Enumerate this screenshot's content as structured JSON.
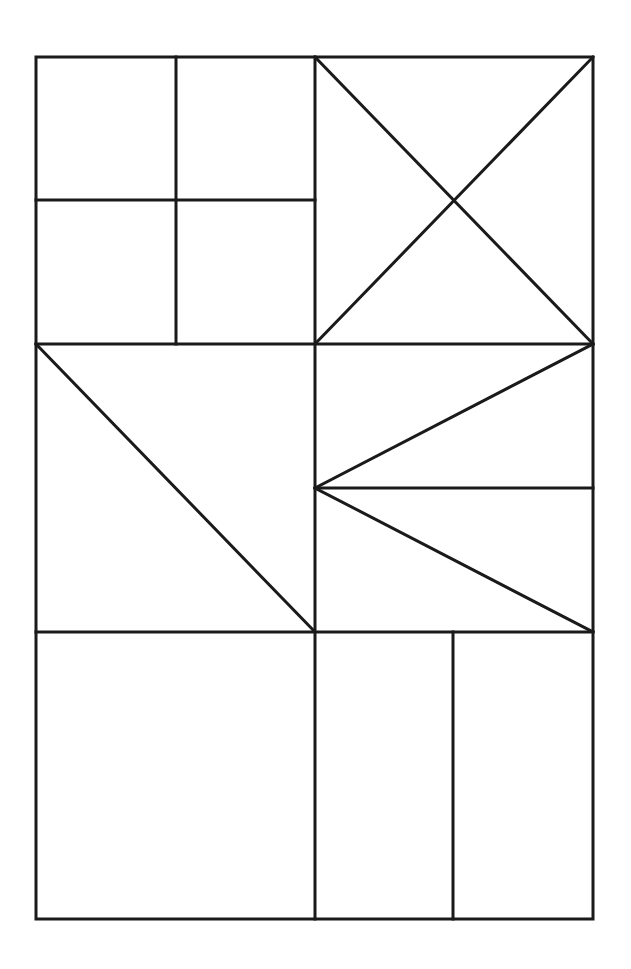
{
  "diagram": {
    "type": "geometric-quilt-grid",
    "stroke_color": "#1a1a1a",
    "background": "#ffffff",
    "outer_frame": {
      "x1": 36,
      "y1": 57,
      "x2": 593,
      "y2": 919
    },
    "cells": [
      {
        "id": "top-left",
        "pattern": "four-patch squares"
      },
      {
        "id": "top-right",
        "pattern": "hourglass X diagonals"
      },
      {
        "id": "middle-left",
        "pattern": "half-square triangle"
      },
      {
        "id": "middle-right",
        "pattern": "two triangles converging to left midpoint"
      },
      {
        "id": "bottom-left",
        "pattern": "plain square"
      },
      {
        "id": "bottom-right",
        "pattern": "two vertical rectangles"
      }
    ]
  }
}
